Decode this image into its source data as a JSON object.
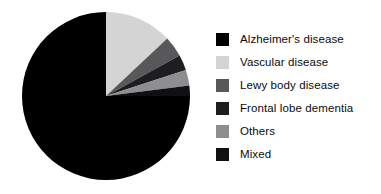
{
  "chart_data": {
    "type": "pie",
    "title": "",
    "subtitle": "",
    "xlabel": "",
    "ylabel": "",
    "grid": false,
    "legend_position": "right",
    "start_angle_deg": 0,
    "direction": "clockwise",
    "categories": [
      "Alzheimer's disease",
      "Vascular disease",
      "Lewy body disease",
      "Frontal lobe dementia",
      "Others",
      "Mixed"
    ],
    "values": [
      75,
      13,
      4,
      3,
      3,
      2
    ],
    "colors": [
      "#000000",
      "#d4d4d4",
      "#58585a",
      "#1e1e20",
      "#8e8e90",
      "#101012"
    ],
    "series": [
      {
        "name": "Dementia subtype distribution",
        "values": [
          75,
          13,
          4,
          3,
          3,
          2
        ]
      }
    ]
  },
  "legend": {
    "items": [
      {
        "label": "Alzheimer's disease",
        "color": "#000000"
      },
      {
        "label": "Vascular disease",
        "color": "#d4d4d4"
      },
      {
        "label": "Lewy body disease",
        "color": "#58585a"
      },
      {
        "label": "Frontal lobe dementia",
        "color": "#1e1e20"
      },
      {
        "label": "Others",
        "color": "#8e8e90"
      },
      {
        "label": "Mixed",
        "color": "#101012"
      }
    ]
  }
}
